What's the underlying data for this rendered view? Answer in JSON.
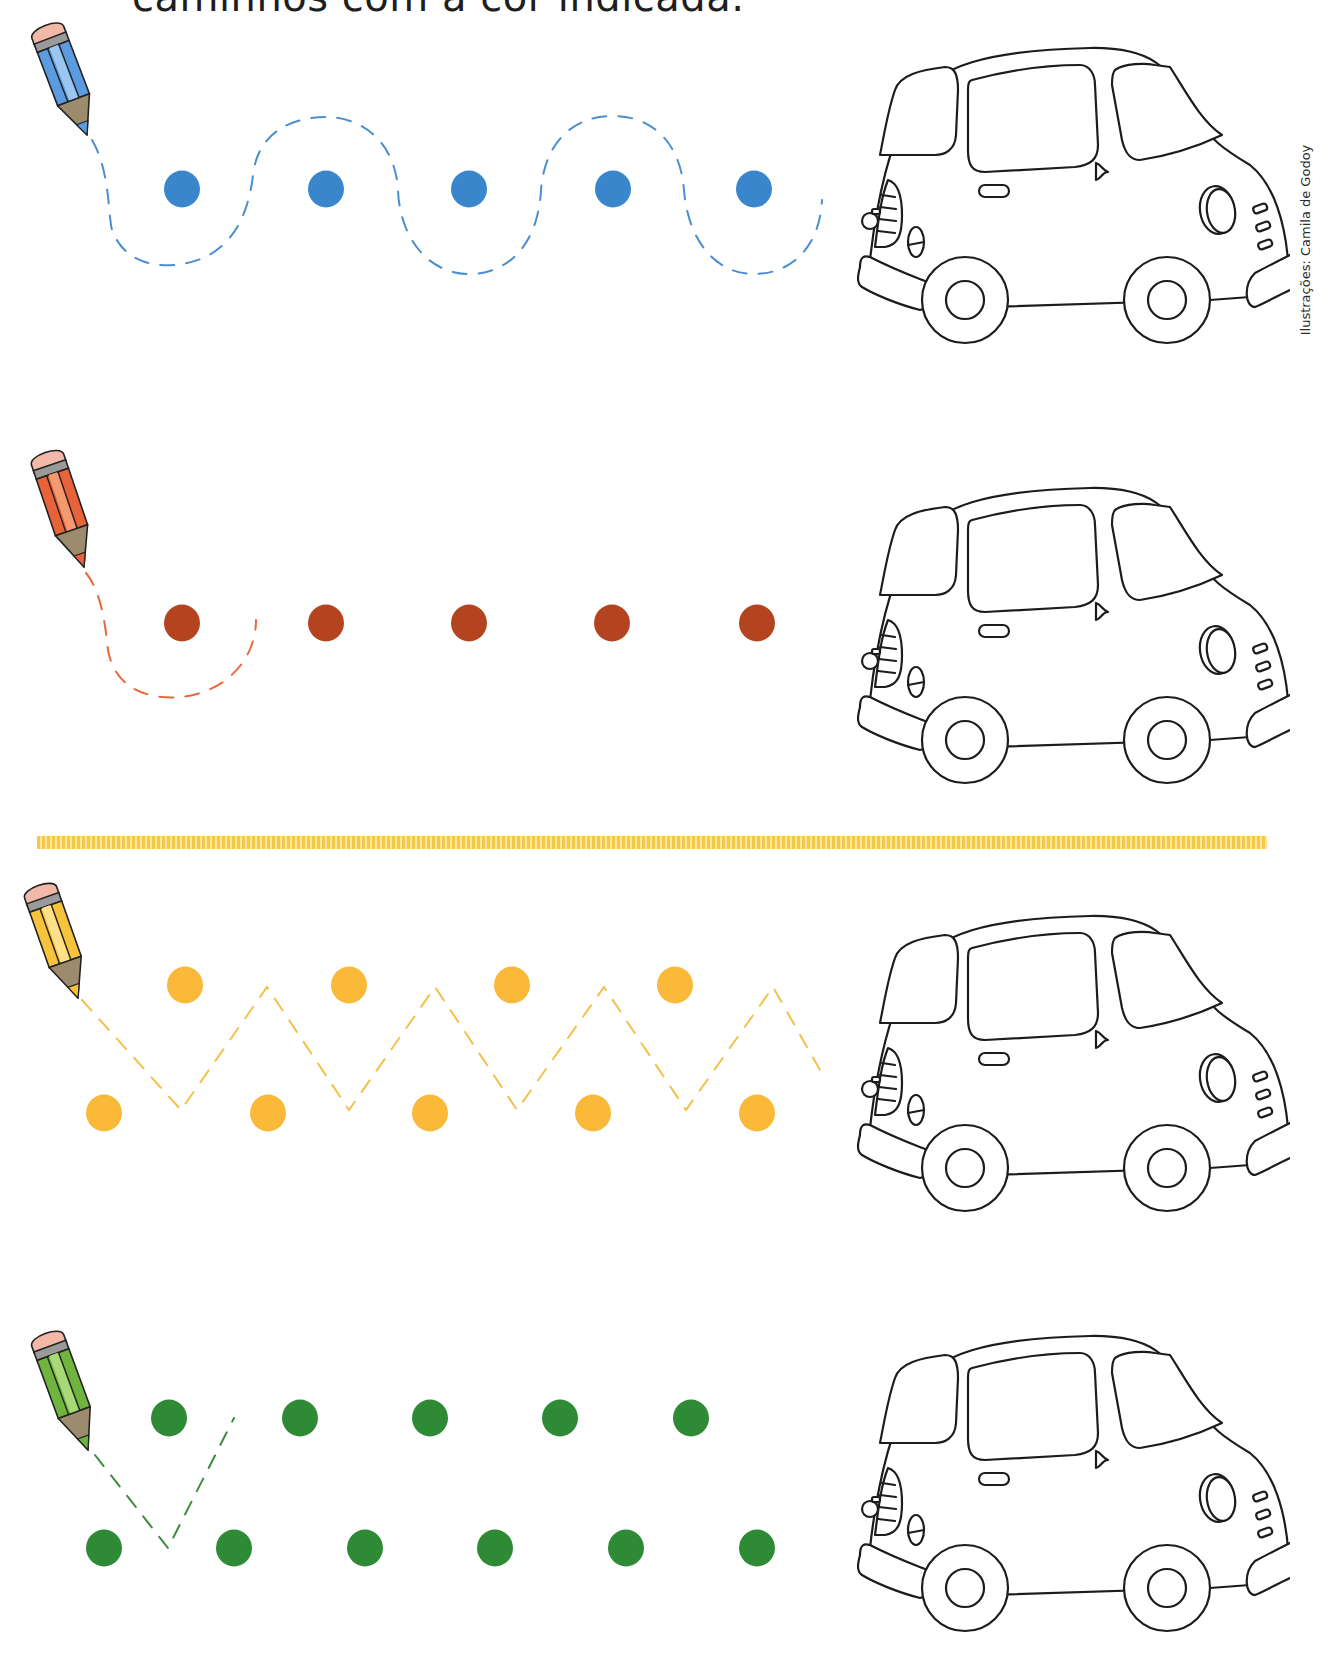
{
  "page": {
    "instruction_text": "caminhos com a cor indicada.",
    "credit_text": "Ilustrações: Camila de Godoy"
  },
  "exercises": [
    {
      "id": "row-1",
      "color_name": "blue",
      "dot_color": "#3a86cc",
      "dash_color": "#4a8ed0",
      "pencil_body": "#5b9be0",
      "pencil_light": "#9cc6f0",
      "path_shape": "wave",
      "dots_top": 0,
      "dots_middle": 5,
      "dots_bottom": 0,
      "pencil_icon": "blue-pencil-icon",
      "car_icon": "car-outline-icon"
    },
    {
      "id": "row-2",
      "color_name": "red",
      "dot_color": "#b3441f",
      "dash_color": "#e8683a",
      "pencil_body": "#e8633a",
      "pencil_light": "#f59a70",
      "path_shape": "partial-loop",
      "dots_top": 0,
      "dots_middle": 5,
      "dots_bottom": 0,
      "pencil_icon": "red-pencil-icon",
      "car_icon": "car-outline-icon"
    },
    {
      "id": "row-3",
      "color_name": "yellow",
      "dot_color": "#fbb93a",
      "dash_color": "#f5c04a",
      "pencil_body": "#f7c23c",
      "pencil_light": "#fde08a",
      "path_shape": "zigzag",
      "dots_top": 4,
      "dots_middle": 0,
      "dots_bottom": 5,
      "pencil_icon": "yellow-pencil-icon",
      "car_icon": "car-outline-icon"
    },
    {
      "id": "row-4",
      "color_name": "green",
      "dot_color": "#2f8a36",
      "dash_color": "#3f8a3f",
      "pencil_body": "#6fb43c",
      "pencil_light": "#a8d878",
      "path_shape": "partial-zigzag",
      "dots_top": 5,
      "dots_middle": 0,
      "dots_bottom": 6,
      "pencil_icon": "green-pencil-icon",
      "car_icon": "car-outline-icon"
    }
  ],
  "divider": {
    "color": "#f5c84a",
    "name": "dotted-divider"
  }
}
